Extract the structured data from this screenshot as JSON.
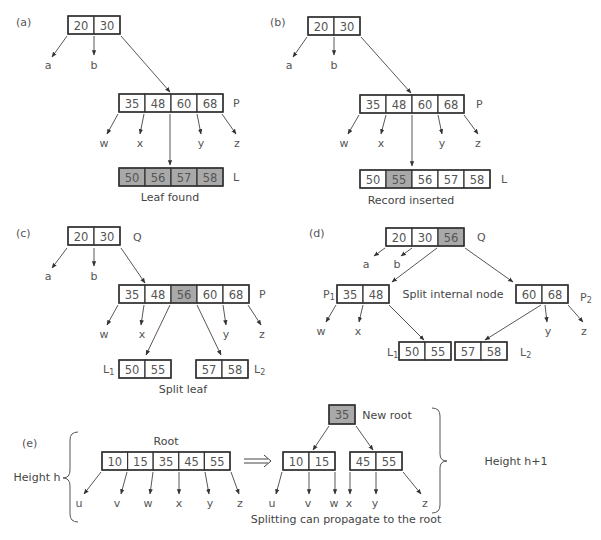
{
  "colors": {
    "highlight": "#a9a9a9",
    "stroke": "#333333",
    "text": "#555555"
  },
  "panels": [
    {
      "id": "a",
      "tag": "(a)",
      "tag_pos": [
        16,
        22
      ],
      "caption": "Leaf found",
      "caption_pos": [
        170,
        197
      ],
      "nodes": [
        {
          "name": "root",
          "x": 68,
          "y": 16,
          "cw": 26,
          "h": 18,
          "keys": [
            "20",
            "30"
          ],
          "hl": []
        },
        {
          "name": "P",
          "label": "P",
          "x": 119,
          "y": 94,
          "cw": 26,
          "h": 18,
          "keys": [
            "35",
            "48",
            "60",
            "68"
          ],
          "hl": [],
          "label_pos": [
            233,
            103
          ]
        },
        {
          "name": "L",
          "label": "L",
          "x": 119,
          "y": 168,
          "cw": 26,
          "h": 18,
          "keys": [
            "50",
            "56",
            "57",
            "58"
          ],
          "hl": [
            0,
            1,
            2,
            3
          ],
          "label_pos": [
            233,
            177
          ]
        }
      ],
      "leaves": [
        {
          "t": "a",
          "x": 48,
          "y": 65
        },
        {
          "t": "b",
          "x": 94,
          "y": 65
        },
        {
          "t": "w",
          "x": 104,
          "y": 143
        },
        {
          "t": "x",
          "x": 140,
          "y": 143
        },
        {
          "t": "y",
          "x": 201,
          "y": 143
        },
        {
          "t": "z",
          "x": 237,
          "y": 143
        }
      ],
      "edges": [
        [
          67,
          36,
          52,
          57
        ],
        [
          94,
          36,
          94,
          55
        ],
        [
          121,
          36,
          170,
          92
        ],
        [
          118,
          114,
          107,
          134
        ],
        [
          144,
          114,
          140,
          134
        ],
        [
          170,
          114,
          170,
          165
        ],
        [
          197,
          114,
          201,
          134
        ],
        [
          222,
          114,
          236,
          134
        ]
      ]
    },
    {
      "id": "b",
      "tag": "(b)",
      "tag_pos": [
        270,
        22
      ],
      "caption": "Record inserted",
      "caption_pos": [
        411,
        200
      ],
      "nodes": [
        {
          "name": "root",
          "x": 308,
          "y": 17,
          "cw": 26,
          "h": 18,
          "keys": [
            "20",
            "30"
          ],
          "hl": []
        },
        {
          "name": "P",
          "label": "P",
          "x": 360,
          "y": 95,
          "cw": 26,
          "h": 18,
          "keys": [
            "35",
            "48",
            "60",
            "68"
          ],
          "hl": [],
          "label_pos": [
            476,
            104
          ]
        },
        {
          "name": "L",
          "label": "L",
          "x": 360,
          "y": 170,
          "cw": 26,
          "h": 18,
          "keys": [
            "50",
            "55",
            "56",
            "57",
            "58"
          ],
          "hl": [
            1
          ],
          "label_pos": [
            501,
            179
          ]
        }
      ],
      "leaves": [
        {
          "t": "a",
          "x": 289,
          "y": 65
        },
        {
          "t": "b",
          "x": 334,
          "y": 65
        },
        {
          "t": "w",
          "x": 344,
          "y": 143
        },
        {
          "t": "x",
          "x": 381,
          "y": 143
        },
        {
          "t": "y",
          "x": 442,
          "y": 143
        },
        {
          "t": "z",
          "x": 478,
          "y": 143
        }
      ],
      "edges": [
        [
          307,
          37,
          293,
          57
        ],
        [
          334,
          37,
          334,
          55
        ],
        [
          361,
          37,
          411,
          93
        ],
        [
          359,
          115,
          348,
          134
        ],
        [
          386,
          115,
          381,
          134
        ],
        [
          412,
          115,
          412,
          166
        ],
        [
          438,
          115,
          442,
          134
        ],
        [
          464,
          115,
          478,
          134
        ]
      ]
    },
    {
      "id": "c",
      "tag": "(c)",
      "tag_pos": [
        16,
        233
      ],
      "caption": "Split leaf",
      "caption_pos": [
        183,
        389
      ],
      "nodes": [
        {
          "name": "Q",
          "label": "Q",
          "x": 68,
          "y": 227,
          "cw": 26,
          "h": 18,
          "keys": [
            "20",
            "30"
          ],
          "hl": [],
          "label_pos": [
            133,
            237
          ]
        },
        {
          "name": "P",
          "label": "P",
          "x": 119,
          "y": 285,
          "cw": 26,
          "h": 18,
          "keys": [
            "35",
            "48",
            "56",
            "60",
            "68"
          ],
          "hl": [
            2
          ],
          "label_pos": [
            259,
            294
          ]
        },
        {
          "name": "L1",
          "label": "L1",
          "x": 119,
          "y": 360,
          "cw": 26,
          "h": 18,
          "keys": [
            "50",
            "55"
          ],
          "hl": [],
          "label_pos": [
            103,
            369
          ]
        },
        {
          "name": "L2",
          "label": "L2",
          "x": 196,
          "y": 360,
          "cw": 26,
          "h": 18,
          "keys": [
            "57",
            "58"
          ],
          "hl": [],
          "label_pos": [
            254,
            369
          ]
        }
      ],
      "leaves": [
        {
          "t": "a",
          "x": 48,
          "y": 276
        },
        {
          "t": "b",
          "x": 94,
          "y": 276
        },
        {
          "t": "w",
          "x": 104,
          "y": 334
        },
        {
          "t": "x",
          "x": 142,
          "y": 334
        },
        {
          "t": "y",
          "x": 226,
          "y": 334
        },
        {
          "t": "z",
          "x": 262,
          "y": 334
        }
      ],
      "edges": [
        [
          67,
          248,
          52,
          268
        ],
        [
          94,
          248,
          94,
          266
        ],
        [
          121,
          248,
          145,
          283
        ],
        [
          118,
          305,
          107,
          325
        ],
        [
          144,
          305,
          141,
          325
        ],
        [
          170,
          305,
          146,
          355
        ],
        [
          197,
          305,
          221,
          355
        ],
        [
          223,
          305,
          226,
          325
        ],
        [
          248,
          305,
          261,
          325
        ]
      ]
    },
    {
      "id": "d",
      "tag": "(d)",
      "tag_pos": [
        309,
        233
      ],
      "caption": "Split internal node",
      "caption_pos": [
        453,
        294
      ],
      "nodes": [
        {
          "name": "Q",
          "label": "Q",
          "x": 386,
          "y": 228,
          "cw": 26,
          "h": 18,
          "keys": [
            "20",
            "30",
            "56"
          ],
          "hl": [
            2
          ],
          "label_pos": [
            477,
            237
          ]
        },
        {
          "name": "P1",
          "label": "P1",
          "x": 337,
          "y": 285,
          "cw": 26,
          "h": 18,
          "keys": [
            "35",
            "48"
          ],
          "hl": [],
          "label_pos": [
            323,
            294
          ]
        },
        {
          "name": "P2",
          "label": "P2",
          "x": 516,
          "y": 285,
          "cw": 26,
          "h": 18,
          "keys": [
            "60",
            "68"
          ],
          "hl": [],
          "label_pos": [
            580,
            297
          ]
        },
        {
          "name": "L1",
          "label": "L1",
          "x": 399,
          "y": 342,
          "cw": 26,
          "h": 18,
          "keys": [
            "50",
            "55"
          ],
          "hl": [],
          "label_pos": [
            387,
            352
          ]
        },
        {
          "name": "L2",
          "label": "L2",
          "x": 455,
          "y": 342,
          "cw": 26,
          "h": 18,
          "keys": [
            "57",
            "58"
          ],
          "hl": [],
          "label_pos": [
            520,
            352
          ]
        }
      ],
      "leaves": [
        {
          "t": "a",
          "x": 366,
          "y": 264
        },
        {
          "t": "b",
          "x": 397,
          "y": 264
        },
        {
          "t": "w",
          "x": 321,
          "y": 331
        },
        {
          "t": "x",
          "x": 358,
          "y": 331
        },
        {
          "t": "y",
          "x": 548,
          "y": 331
        },
        {
          "t": "z",
          "x": 584,
          "y": 331
        }
      ],
      "edges": [
        [
          385,
          248,
          374,
          256
        ],
        [
          412,
          248,
          401,
          256
        ],
        [
          437,
          248,
          392,
          282
        ],
        [
          465,
          248,
          513,
          282
        ],
        [
          336,
          305,
          326,
          322
        ],
        [
          363,
          305,
          359,
          322
        ],
        [
          389,
          305,
          424,
          340
        ],
        [
          541,
          305,
          485,
          340
        ],
        [
          545,
          305,
          547,
          322
        ],
        [
          568,
          305,
          583,
          322
        ]
      ]
    },
    {
      "id": "e",
      "tag": "(e)",
      "tag_pos": [
        22,
        443
      ],
      "root_label": "Root",
      "root_label_pos": [
        166,
        441
      ],
      "new_root_label": "New root",
      "new_root_label_pos": [
        387,
        415
      ],
      "height_left": "Height h",
      "height_left_pos": [
        37,
        477
      ],
      "height_right": "Height h+1",
      "height_right_pos": [
        516,
        461
      ],
      "caption": "Splitting can propagate to the root",
      "caption_pos": [
        346,
        519
      ],
      "implies_arrow": "⟹",
      "nodes": [
        {
          "name": "root-old",
          "x": 102,
          "y": 452,
          "cw": 25.6,
          "h": 18,
          "keys": [
            "10",
            "15",
            "35",
            "45",
            "55"
          ],
          "hl": []
        },
        {
          "name": "new-root",
          "x": 329,
          "y": 405,
          "cw": 26,
          "h": 19,
          "keys": [
            "35"
          ],
          "hl": [
            0
          ]
        },
        {
          "name": "left-child",
          "x": 283,
          "y": 452,
          "cw": 26,
          "h": 18,
          "keys": [
            "10",
            "15"
          ],
          "hl": []
        },
        {
          "name": "right-child",
          "x": 350,
          "y": 452,
          "cw": 26,
          "h": 18,
          "keys": [
            "45",
            "55"
          ],
          "hl": []
        }
      ],
      "leaves": [
        {
          "t": "u",
          "x": 79,
          "y": 503
        },
        {
          "t": "v",
          "x": 117,
          "y": 503
        },
        {
          "t": "w",
          "x": 148,
          "y": 503
        },
        {
          "t": "x",
          "x": 179,
          "y": 503
        },
        {
          "t": "y",
          "x": 210,
          "y": 503
        },
        {
          "t": "z",
          "x": 240,
          "y": 503
        },
        {
          "t": "u",
          "x": 272,
          "y": 503
        },
        {
          "t": "v",
          "x": 308,
          "y": 503
        },
        {
          "t": "w",
          "x": 334,
          "y": 503
        },
        {
          "t": "x",
          "x": 349,
          "y": 503
        },
        {
          "t": "y",
          "x": 375,
          "y": 503
        },
        {
          "t": "z",
          "x": 425,
          "y": 503
        }
      ],
      "edges": [
        [
          101,
          472,
          84,
          494
        ],
        [
          127,
          472,
          121,
          494
        ],
        [
          153,
          472,
          150,
          494
        ],
        [
          179,
          472,
          179,
          494
        ],
        [
          205,
          472,
          209,
          494
        ],
        [
          231,
          472,
          239,
          494
        ],
        [
          329,
          426,
          313,
          450
        ],
        [
          356,
          426,
          373,
          450
        ],
        [
          282,
          472,
          276,
          494
        ],
        [
          309,
          472,
          309,
          494
        ],
        [
          335,
          472,
          335,
          494
        ],
        [
          350,
          472,
          350,
          494
        ],
        [
          376,
          472,
          376,
          494
        ],
        [
          403,
          472,
          421,
          494
        ]
      ]
    }
  ]
}
